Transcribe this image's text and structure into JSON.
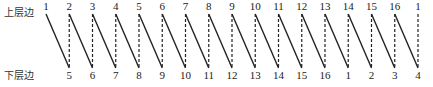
{
  "labels": {
    "upper": "上层边",
    "lower": "下层边"
  },
  "top_numbers": [
    "1",
    "2",
    "3",
    "4",
    "5",
    "6",
    "7",
    "8",
    "9",
    "10",
    "11",
    "12",
    "13",
    "14",
    "15",
    "16",
    "1"
  ],
  "bottom_numbers": [
    "5",
    "6",
    "7",
    "8",
    "9",
    "10",
    "11",
    "12",
    "13",
    "14",
    "15",
    "16",
    "1",
    "2",
    "3",
    "4"
  ],
  "colors": {
    "line": "#222222",
    "text": "#222222"
  }
}
